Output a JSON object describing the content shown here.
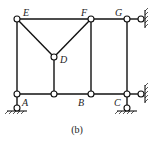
{
  "figure": {
    "caption": "(b)",
    "nodes": {
      "E": {
        "label": "E",
        "x": 17,
        "y": 19
      },
      "F": {
        "label": "F",
        "x": 91,
        "y": 19
      },
      "G": {
        "label": "G",
        "x": 127,
        "y": 19
      },
      "D": {
        "label": "D",
        "x": 54,
        "y": 57
      },
      "A": {
        "label": "A",
        "x": 17,
        "y": 94
      },
      "M": {
        "label": "",
        "x": 54,
        "y": 94
      },
      "B": {
        "label": "B",
        "x": 91,
        "y": 94
      },
      "C": {
        "label": "C",
        "x": 127,
        "y": 94
      }
    },
    "members": [
      [
        "E",
        "F"
      ],
      [
        "F",
        "G"
      ],
      [
        "E",
        "A"
      ],
      [
        "E",
        "D"
      ],
      [
        "F",
        "D"
      ],
      [
        "D",
        "M"
      ],
      [
        "F",
        "B"
      ],
      [
        "G",
        "C"
      ],
      [
        "A",
        "M"
      ],
      [
        "M",
        "B"
      ],
      [
        "B",
        "C"
      ]
    ],
    "supports": [
      {
        "node": "A",
        "type": "pin-bottom"
      },
      {
        "node": "C",
        "type": "pin-bottom"
      },
      {
        "node": "C",
        "type": "link-right"
      },
      {
        "node": "G",
        "type": "link-right"
      }
    ]
  }
}
